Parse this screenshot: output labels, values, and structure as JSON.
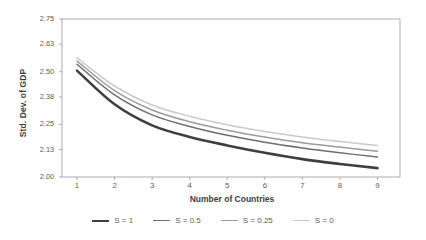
{
  "chart_data": {
    "type": "line",
    "title": "",
    "xlabel": "Number of Countries",
    "ylabel": "Std. Dev. of GDP",
    "x": [
      1,
      2,
      3,
      4,
      5,
      6,
      7,
      8,
      9
    ],
    "xlim": [
      0.6,
      9.6
    ],
    "ylim": [
      2.0,
      2.75
    ],
    "yticks": [
      2.75,
      2.63,
      2.5,
      2.38,
      2.25,
      2.13,
      2.0
    ],
    "ytick_labels": [
      "2.75",
      "2.63",
      "2.50",
      "2.38",
      "2.25",
      "2.13",
      "2.00"
    ],
    "xticks": [
      1,
      2,
      3,
      4,
      5,
      6,
      7,
      8,
      9
    ],
    "xtick_labels": [
      "1",
      "2",
      "3",
      "4",
      "5",
      "6",
      "7",
      "8",
      "9"
    ],
    "grid": false,
    "legend_position": "bottom",
    "series": [
      {
        "name": "S = 1",
        "color": "#3f3f3f",
        "width": 2.6,
        "values": [
          2.505,
          2.345,
          2.245,
          2.19,
          2.15,
          2.115,
          2.085,
          2.062,
          2.042
        ]
      },
      {
        "name": "S = 0.5",
        "color": "#6e6e6e",
        "width": 1.5,
        "values": [
          2.535,
          2.39,
          2.295,
          2.24,
          2.198,
          2.165,
          2.138,
          2.115,
          2.095
        ]
      },
      {
        "name": "S = 0.25",
        "color": "#9b9b9b",
        "width": 1.5,
        "values": [
          2.55,
          2.41,
          2.318,
          2.262,
          2.222,
          2.19,
          2.163,
          2.142,
          2.122
        ]
      },
      {
        "name": "S = 0",
        "color": "#cacaca",
        "width": 1.5,
        "values": [
          2.565,
          2.432,
          2.342,
          2.288,
          2.248,
          2.216,
          2.19,
          2.168,
          2.15
        ]
      }
    ]
  },
  "legend": {
    "entries": [
      {
        "label": "S = 1"
      },
      {
        "label": "S = 0.5"
      },
      {
        "label": "S = 0.25"
      },
      {
        "label": "S = 0"
      }
    ]
  }
}
